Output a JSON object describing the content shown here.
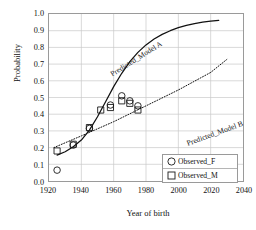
{
  "chart_data": {
    "type": "scatter",
    "title": "",
    "xlabel": "Year of birth",
    "ylabel": "Probability",
    "xlim": [
      1920,
      2040
    ],
    "ylim": [
      0.0,
      1.0
    ],
    "xticks": [
      1920,
      1940,
      1960,
      1980,
      2000,
      2020,
      2040
    ],
    "yticks": [
      "0.0",
      "0.1",
      "0.2",
      "0.3",
      "0.4",
      "0.5",
      "0.6",
      "0.7",
      "0.8",
      "0.9",
      "1.0"
    ],
    "grid": true,
    "legend_position": "lower-right-inside",
    "legend": [
      {
        "label": "Observed_F",
        "marker": "circle"
      },
      {
        "label": "Observed_M",
        "marker": "square"
      }
    ],
    "annotations": [
      {
        "text": "Predicted_Model A",
        "rotation": -32
      },
      {
        "text": "Predicted_Model B",
        "rotation": -20
      }
    ],
    "series": [
      {
        "name": "Predicted_Model A",
        "type": "line",
        "style": "solid",
        "x": [
          1925,
          1930,
          1935,
          1940,
          1945,
          1950,
          1955,
          1960,
          1965,
          1970,
          1975,
          1980,
          1985,
          1990,
          1995,
          2000,
          2005,
          2010,
          2015,
          2020,
          2025
        ],
        "y": [
          0.155,
          0.175,
          0.205,
          0.245,
          0.305,
          0.385,
          0.475,
          0.565,
          0.645,
          0.715,
          0.77,
          0.815,
          0.85,
          0.878,
          0.9,
          0.918,
          0.932,
          0.943,
          0.951,
          0.957,
          0.962
        ]
      },
      {
        "name": "Predicted_Model B",
        "type": "line",
        "style": "dotted",
        "x": [
          1923,
          1940,
          1960,
          1980,
          2000,
          2020,
          2030
        ],
        "y": [
          0.2,
          0.27,
          0.355,
          0.45,
          0.545,
          0.65,
          0.728
        ]
      },
      {
        "name": "Observed_F",
        "type": "scatter",
        "marker": "circle",
        "x": [
          1925,
          1935,
          1945,
          1958,
          1965,
          1970,
          1975
        ],
        "y": [
          0.065,
          0.215,
          0.315,
          0.455,
          0.51,
          0.48,
          0.45
        ]
      },
      {
        "name": "Observed_M",
        "type": "scatter",
        "marker": "square",
        "x": [
          1925,
          1935,
          1945,
          1952,
          1958,
          1965,
          1970,
          1975
        ],
        "y": [
          0.18,
          0.22,
          0.32,
          0.425,
          0.44,
          0.48,
          0.465,
          0.425
        ]
      }
    ]
  }
}
